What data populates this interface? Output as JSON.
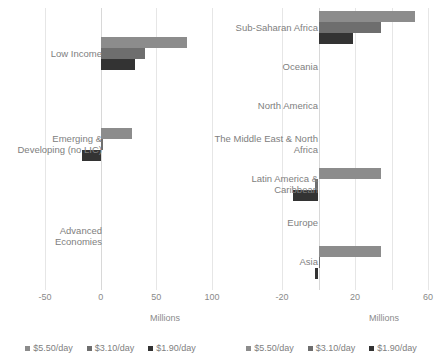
{
  "series_names": [
    "$5.50/day",
    "$3.10/day",
    "$1.90/day"
  ],
  "series_colors": [
    "#8c8c8c",
    "#6e6e6e",
    "#333333"
  ],
  "axis_title": "Millions",
  "left": {
    "ticks": [
      "-50",
      "0",
      "50",
      "100"
    ],
    "categories": [
      "Low Income",
      "Emerging &\nDeveloping (no LIC)",
      "Advanced\nEconomies"
    ]
  },
  "right": {
    "ticks": [
      "-20",
      "20",
      "60"
    ],
    "categories": [
      "Sub-Saharan Africa",
      "Oceania",
      "North America",
      "The Middle East & North\nAfrica",
      "Latin America &\nCaribbean",
      "Europe",
      "Asia"
    ]
  },
  "chart_data": [
    {
      "type": "bar",
      "orientation": "horizontal",
      "title": "",
      "xlabel": "Millions",
      "ylabel": "",
      "xlim": [
        -50,
        100
      ],
      "xticks": [
        -50,
        0,
        50,
        100
      ],
      "grid": true,
      "legend_position": "bottom",
      "categories": [
        "Low Income",
        "Emerging & Developing (no LIC)",
        "Advanced Economies"
      ],
      "series": [
        {
          "name": "$5.50/day",
          "values": [
            78,
            28,
            0
          ]
        },
        {
          "name": "$3.10/day",
          "values": [
            40,
            2,
            0
          ]
        },
        {
          "name": "$1.90/day",
          "values": [
            31,
            -17,
            0
          ]
        }
      ]
    },
    {
      "type": "bar",
      "orientation": "horizontal",
      "title": "",
      "xlabel": "Millions",
      "ylabel": "",
      "xlim": [
        -20,
        60
      ],
      "xticks": [
        -20,
        20,
        60
      ],
      "grid": true,
      "legend_position": "bottom",
      "categories": [
        "Sub-Saharan Africa",
        "Oceania",
        "North America",
        "The Middle East & North Africa",
        "Latin America & Caribbean",
        "Europe",
        "Asia"
      ],
      "series": [
        {
          "name": "$5.50/day",
          "values": [
            53,
            0,
            0,
            0,
            34,
            0,
            34
          ]
        },
        {
          "name": "$3.10/day",
          "values": [
            34,
            0,
            0,
            0,
            -2,
            0,
            0.5
          ]
        },
        {
          "name": "$1.90/day",
          "values": [
            19,
            0,
            0,
            0,
            -14,
            0,
            -2
          ]
        }
      ]
    }
  ]
}
